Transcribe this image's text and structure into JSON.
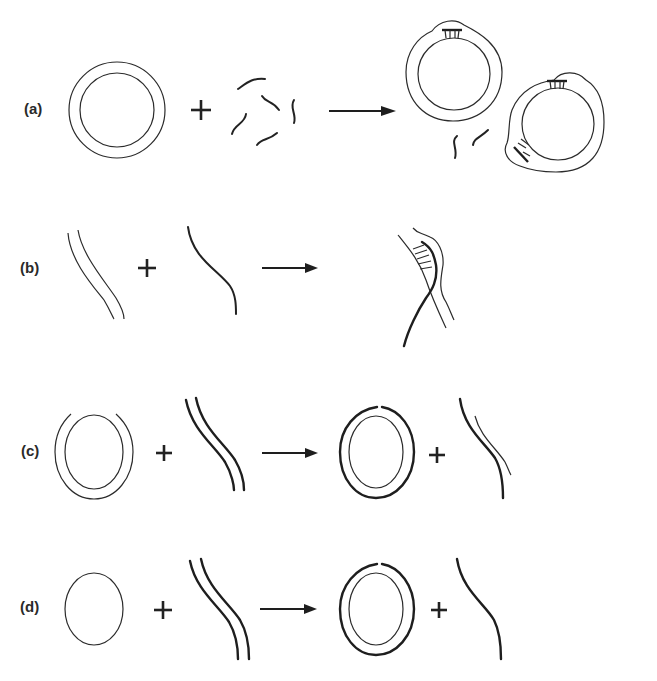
{
  "figure": {
    "type": "schematic diagram",
    "rows": [
      {
        "id": "a",
        "label": "(a)",
        "left": "double-stranded circular DNA",
        "operator": "+",
        "middle": "short single-stranded fragments",
        "result": "circles with annealed short duplex regions + unpaired fragments"
      },
      {
        "id": "b",
        "label": "(b)",
        "left": "double-stranded linear DNA",
        "operator": "+",
        "middle": "single-stranded linear DNA",
        "result": "strand invasion / D-loop"
      },
      {
        "id": "c",
        "label": "(c)",
        "left": "gapped circular duplex",
        "operator": "+",
        "middle": "linear duplex (thick)",
        "result_left": "circle with thick nicked outer strand",
        "result_operator": "+",
        "result_right": "displaced thin+thick linear"
      },
      {
        "id": "d",
        "label": "(d)",
        "left": "single-stranded circle",
        "operator": "+",
        "middle": "linear duplex (thick)",
        "result_left": "circle with thick nicked outer strand",
        "result_operator": "+",
        "result_right": "single thick linear strand"
      }
    ]
  },
  "labels": {
    "a": "(a)",
    "b": "(b)",
    "c": "(c)",
    "d": "(d)"
  },
  "colors": {
    "ink": "#222222",
    "background": "#ffffff"
  }
}
